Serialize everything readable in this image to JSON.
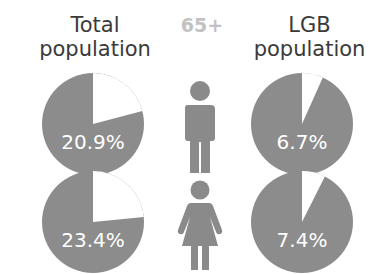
{
  "headers": {
    "total": "Total population",
    "age": "65+",
    "lgb": "LGB population"
  },
  "colors": {
    "pie_fill": "#8c8c8c",
    "slice_fill": "#ffffff",
    "header_text": "#3a3a3a",
    "age_text": "#c2c2c2",
    "icon_fill": "#8a8a8a"
  },
  "rows": [
    {
      "gender_icon": "male-icon",
      "total_pct": "20.9%",
      "lgb_pct": "6.7%"
    },
    {
      "gender_icon": "female-icon",
      "total_pct": "23.4%",
      "lgb_pct": "7.4%"
    }
  ],
  "chart_data": {
    "type": "pie",
    "title": "65+",
    "columns": [
      "Total population",
      "LGB population"
    ],
    "rows": [
      "Male",
      "Female"
    ],
    "series": [
      {
        "name": "Total population",
        "values": [
          20.9,
          23.4
        ]
      },
      {
        "name": "LGB population",
        "values": [
          6.7,
          7.4
        ]
      }
    ],
    "categories": [
      "Male",
      "Female"
    ],
    "unit": "%"
  }
}
